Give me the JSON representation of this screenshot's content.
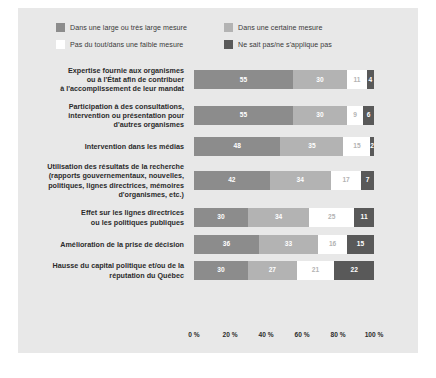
{
  "legend": {
    "items": [
      {
        "label": "Dans une large ou très large mesure",
        "color": "#8c8c8c",
        "icon": "legend-swatch-icon"
      },
      {
        "label": "Dans une certaine mesure",
        "color": "#b3b3b3",
        "icon": "legend-swatch-icon"
      },
      {
        "label": "Pas du tout/dans une faible mesure",
        "color": "#ffffff",
        "icon": "legend-swatch-icon"
      },
      {
        "label": "Ne sait pas/ne s'applique pas",
        "color": "#595959",
        "icon": "legend-swatch-icon"
      }
    ]
  },
  "axis": {
    "ticks": [
      "0 %",
      "20 %",
      "40 %",
      "60 %",
      "80 %",
      "100 %"
    ]
  },
  "chart_data": {
    "type": "bar",
    "title": "",
    "xlabel": "",
    "ylabel": "",
    "orientation": "horizontal",
    "stacked": true,
    "stack_total": 100,
    "xlim": [
      0,
      100
    ],
    "grid": false,
    "legend_position": "top",
    "categories": [
      "Expertise fournie aux organismes ou à l'État afin de contribuer à l'accomplissement de leur mandat",
      "Participation à des consultations, intervention ou présentation pour d'autres organismes",
      "Intervention dans les médias",
      "Utilisation des résultats de la recherche (rapports gouvernementaux, nouvelles, politiques, lignes directrices, mémoires d'organismes, etc.)",
      "Effet sur les lignes directrices ou les politiques publiques",
      "Amélioration de la prise de décision",
      "Hausse du capital politique et/ou de la réputation du Québec"
    ],
    "category_lines": [
      [
        "Expertise fournie aux organismes",
        "ou à l'État afin de contribuer",
        "à l'accomplissement de leur mandat"
      ],
      [
        "Participation à des consultations,",
        "intervention ou présentation pour",
        "d'autres organismes"
      ],
      [
        "Intervention dans les médias"
      ],
      [
        "Utilisation des résultats de la recherche",
        "(rapports gouvernementaux, nouvelles,",
        "politiques, lignes directrices, mémoires",
        "d'organismes, etc.)"
      ],
      [
        "Effet sur les lignes directrices",
        "ou les politiques publiques"
      ],
      [
        "Amélioration de la prise de décision"
      ],
      [
        "Hausse du capital politique et/ou de la",
        "réputation du Québec"
      ]
    ],
    "series": [
      {
        "name": "Dans une large ou très large mesure",
        "color": "#8c8c8c",
        "text_color": "#ffffff",
        "values": [
          55,
          55,
          48,
          42,
          30,
          36,
          30
        ]
      },
      {
        "name": "Dans une certaine mesure",
        "color": "#b3b3b3",
        "text_color": "#ffffff",
        "values": [
          30,
          30,
          35,
          34,
          34,
          33,
          27
        ]
      },
      {
        "name": "Pas du tout/dans une faible mesure",
        "color": "#ffffff",
        "text_color": "#b3b3b3",
        "values": [
          11,
          9,
          15,
          17,
          25,
          16,
          21
        ]
      },
      {
        "name": "Ne sait pas/ne s'applique pas",
        "color": "#595959",
        "text_color": "#ffffff",
        "values": [
          4,
          6,
          2,
          7,
          11,
          15,
          22
        ]
      }
    ]
  }
}
